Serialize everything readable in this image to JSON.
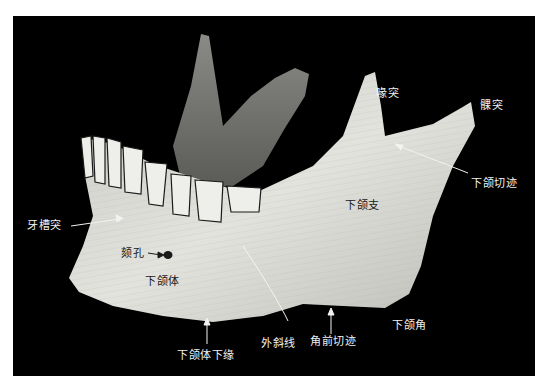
{
  "figure": {
    "background": "#000000",
    "bone_color": "#d9d9d4",
    "label_color_on_dark": "#f2f2f2",
    "label_color_on_bone": "#1a1a1a"
  },
  "labels": {
    "coronoid_process": "喙突",
    "condylar_process": "髁突",
    "mandibular_notch": "下颌切迹",
    "ramus": "下颌支",
    "alveolar_process": "牙槽突",
    "mental_foramen": "颏孔",
    "body": "下颌体",
    "inferior_border": "下颌体下缘",
    "external_oblique_line": "外斜线",
    "antegonial_notch": "角前切迹",
    "mandibular_angle": "下颌角"
  }
}
